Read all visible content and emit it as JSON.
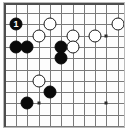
{
  "diagram": {
    "game": "Go",
    "board_size_shown": {
      "columns": 10,
      "rows": 10
    },
    "grid": {
      "origin_x": 12,
      "origin_y": 10,
      "spacing": 11.3,
      "columns": 10,
      "rows": 10,
      "line_color": "#7a7a7a",
      "edge_color": "#4d4d4d",
      "background_color": "#fdfdfd"
    },
    "edges_shown": [
      "top",
      "left"
    ],
    "colors": {
      "black_stone": "#0a0a0a",
      "white_stone": "#ffffff",
      "stone_outline": "#1a1a1a",
      "move_label_on_black": "#ffffff",
      "hoshi": "#2b2b2b",
      "frame": "#b9b9b9"
    },
    "hoshi_points": [
      {
        "col": 3,
        "row": 3
      },
      {
        "col": 3,
        "row": 9
      },
      {
        "col": 9,
        "row": 3
      },
      {
        "col": 9,
        "row": 9
      }
    ],
    "stones": [
      {
        "color": "black",
        "col": 1,
        "row": 2,
        "label": "1"
      },
      {
        "color": "white",
        "col": 4,
        "row": 2,
        "label": ""
      },
      {
        "color": "white",
        "col": 10,
        "row": 2,
        "label": ""
      },
      {
        "color": "white",
        "col": 3,
        "row": 3,
        "label": ""
      },
      {
        "color": "white",
        "col": 6,
        "row": 3,
        "label": ""
      },
      {
        "color": "white",
        "col": 8,
        "row": 3,
        "label": ""
      },
      {
        "color": "black",
        "col": 1,
        "row": 4,
        "label": ""
      },
      {
        "color": "black",
        "col": 2,
        "row": 4,
        "label": ""
      },
      {
        "color": "black",
        "col": 5,
        "row": 4,
        "label": ""
      },
      {
        "color": "white",
        "col": 6,
        "row": 4,
        "label": ""
      },
      {
        "color": "black",
        "col": 5,
        "row": 5,
        "label": ""
      },
      {
        "color": "white",
        "col": 3,
        "row": 7,
        "label": ""
      },
      {
        "color": "black",
        "col": 4,
        "row": 8,
        "label": ""
      },
      {
        "color": "black",
        "col": 2,
        "row": 9,
        "label": ""
      }
    ],
    "move_numbers": [
      "1"
    ]
  }
}
